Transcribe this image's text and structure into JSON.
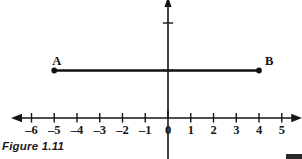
{
  "figure": {
    "caption": "Figure 1.11",
    "width": 302,
    "height": 159,
    "background_color": "#ffffff",
    "ink_color": "#161616"
  },
  "chart_data": {
    "type": "scatter",
    "title": "Figure 1.11",
    "subtitle": "",
    "xlabel": "",
    "ylabel": "",
    "grid": false,
    "legend_position": "none",
    "xlim": [
      -6.9,
      5.9
    ],
    "ylim": [
      -1.05,
      2.55
    ],
    "x_ticks": [
      -6,
      -5,
      -4,
      -3,
      -2,
      -1,
      0,
      1,
      2,
      3,
      4,
      5
    ],
    "x_tick_labels": [
      "–6",
      "–5",
      "–4",
      "–3",
      "–2",
      "–1",
      "0",
      "1",
      "2",
      "3",
      "4",
      "5"
    ],
    "y_ticks": [
      1,
      2
    ],
    "y_tick_labels": [
      "",
      ""
    ],
    "x_axis_arrows": [
      "left",
      "right"
    ],
    "y_axis_arrows": [
      "up"
    ],
    "points": [
      {
        "name": "A",
        "label": "A",
        "x": -5,
        "y": 1,
        "label_dx": -2,
        "label_dy": -16
      },
      {
        "name": "B",
        "label": "B",
        "x": 4,
        "y": 1,
        "label_dx": 6,
        "label_dy": -16
      }
    ],
    "segments": [
      {
        "name": "segment-AB",
        "from": "A",
        "to": "B",
        "x1": -5,
        "y1": 1,
        "x2": 4,
        "y2": 1
      }
    ]
  },
  "icons": {
    "arrow_left": "arrow-left-icon",
    "arrow_right": "arrow-right-icon",
    "arrow_up": "arrow-up-icon"
  }
}
